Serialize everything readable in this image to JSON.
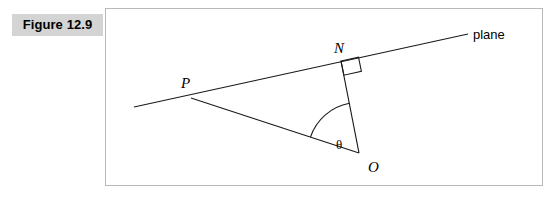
{
  "figure": {
    "label": "Figure 12.9"
  },
  "diagram": {
    "type": "geometry-line-diagram",
    "background": "#ffffff",
    "border_color": "#b9b9b9",
    "stroke_color": "#1a1a1a",
    "labels": {
      "plane": "plane",
      "point_p": "P",
      "point_n": "N",
      "point_o": "O",
      "angle_theta": "θ"
    },
    "points": {
      "P": [
        85,
        89
      ],
      "N": [
        235,
        52
      ],
      "O": [
        253,
        144
      ],
      "plane_line_start": [
        28,
        98
      ],
      "plane_line_end": [
        362,
        25
      ]
    },
    "elements": [
      "plane-line",
      "segment-p-o",
      "segment-n-o",
      "right-angle-marker-at-n",
      "angle-arc-at-o"
    ]
  }
}
